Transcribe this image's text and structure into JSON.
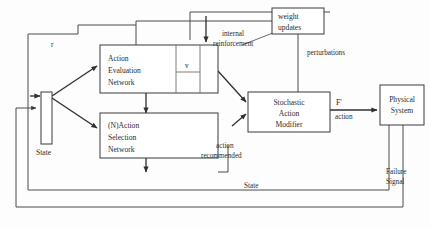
{
  "diagram": {
    "type": "block-diagram",
    "nodes": [
      {
        "id": "action_evaluation_network",
        "label_lines": [
          "Action",
          "Evaluation",
          "Network"
        ],
        "x": 100,
        "y": 45,
        "w": 118,
        "h": 48
      },
      {
        "id": "action_selection_network",
        "label_lines": [
          "(N)Action",
          "Selection",
          "Network"
        ],
        "x": 100,
        "y": 113,
        "w": 118,
        "h": 45
      },
      {
        "id": "stochastic_action_modifier",
        "label_lines": [
          "Stochastic",
          "Action",
          "Modifier"
        ],
        "x": 248,
        "y": 92,
        "w": 82,
        "h": 40
      },
      {
        "id": "physical_system",
        "label_lines": [
          "Physical",
          "System"
        ],
        "x": 380,
        "y": 85,
        "w": 44,
        "h": 40
      },
      {
        "id": "weight_updates",
        "label_lines": [
          "weight",
          "updates"
        ],
        "x": 272,
        "y": 8,
        "w": 52,
        "h": 26
      },
      {
        "id": "state_register",
        "label_lines": [
          "State"
        ],
        "x": 41,
        "y": 92,
        "w": 11,
        "h": 52
      }
    ],
    "labels": {
      "v": "v",
      "r": "r",
      "internal_reinforcement": [
        "internal",
        "reinforcement"
      ],
      "perturbations": "perturbations",
      "weight_updates": [
        "weight",
        "updates"
      ],
      "f_prime": "F'",
      "action": "action",
      "action_recommended": [
        "action",
        "recommended"
      ],
      "state_bottom": "State",
      "state_box": "State",
      "failure_signal": [
        "Failure",
        "Signal"
      ],
      "action_evaluation_network": [
        "Action",
        "Evaluation",
        "Network"
      ],
      "action_selection_network": [
        "(N)Action",
        "Selection",
        "Network"
      ],
      "stochastic_action_modifier": [
        "Stochastic",
        "Action",
        "Modifier"
      ],
      "physical_system": [
        "Physical",
        "System"
      ]
    },
    "colors": {
      "background": "#fdfdfd",
      "box_stroke": "#3a3a3a",
      "connector": "#4a4a4a",
      "arrow": "#2f2f2f",
      "text": "#2b2b2b"
    }
  }
}
